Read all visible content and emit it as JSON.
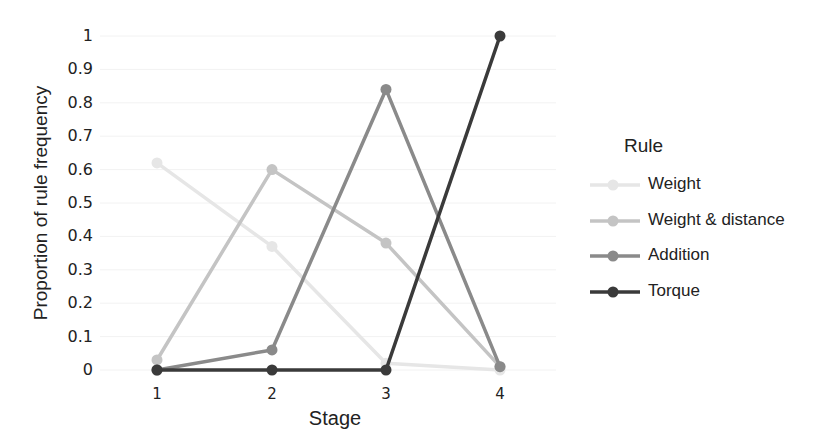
{
  "chart_data": {
    "type": "line",
    "title": "",
    "xlabel": "Stage",
    "ylabel": "Proportion of rule frequency",
    "x": [
      1,
      2,
      3,
      4
    ],
    "categories": [
      "1",
      "2",
      "3",
      "4"
    ],
    "ylim": [
      0,
      1
    ],
    "yticks": [
      "0",
      "0.1",
      "0.2",
      "0.3",
      "0.4",
      "0.5",
      "0.6",
      "0.7",
      "0.8",
      "0.9",
      "1"
    ],
    "grid": true,
    "legend_position": "right",
    "legend_title": "Rule",
    "series": [
      {
        "name": "Weight",
        "values": [
          0.62,
          0.37,
          0.02,
          0.0
        ],
        "color": "#e6e6e6"
      },
      {
        "name": "Weight & distance",
        "values": [
          0.03,
          0.6,
          0.38,
          0.01
        ],
        "color": "#c4c4c4"
      },
      {
        "name": "Addition",
        "values": [
          0.0,
          0.06,
          0.84,
          0.01
        ],
        "color": "#8a8a8a"
      },
      {
        "name": "Torque",
        "values": [
          0.0,
          0.0,
          0.0,
          1.0
        ],
        "color": "#3a3a3a"
      }
    ]
  }
}
